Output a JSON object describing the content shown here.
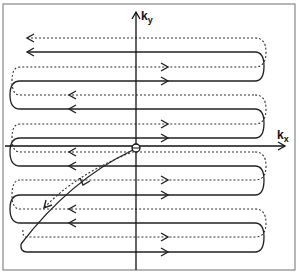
{
  "diagram": {
    "title": "",
    "axes": {
      "x_label": "k",
      "x_label_sub": "x",
      "y_label": "k",
      "y_label_sub": "y"
    },
    "line_styles": {
      "solid": "#222222",
      "dotted": "#333333"
    },
    "origin_marker": "circle-cross",
    "rows": [
      {
        "y": 38,
        "style": "dotted",
        "direction": "left"
      },
      {
        "y": 52,
        "style": "solid",
        "direction": "left"
      },
      {
        "y": 67,
        "style": "dotted",
        "direction": "right"
      },
      {
        "y": 81,
        "style": "solid",
        "direction": "right"
      },
      {
        "y": 95,
        "style": "dotted",
        "direction": "left"
      },
      {
        "y": 109,
        "style": "solid",
        "direction": "left"
      },
      {
        "y": 124,
        "style": "dotted",
        "direction": "right"
      },
      {
        "y": 138,
        "style": "solid",
        "direction": "right"
      },
      {
        "y": 152,
        "style": "dotted",
        "direction": "left"
      },
      {
        "y": 166,
        "style": "solid",
        "direction": "left"
      },
      {
        "y": 180,
        "style": "dotted",
        "direction": "right"
      },
      {
        "y": 195,
        "style": "solid",
        "direction": "right"
      },
      {
        "y": 209,
        "style": "dotted",
        "direction": "left"
      },
      {
        "y": 223,
        "style": "solid",
        "direction": "left"
      },
      {
        "y": 237,
        "style": "dotted",
        "direction": "right"
      },
      {
        "y": 252,
        "style": "solid",
        "direction": "right"
      }
    ]
  }
}
